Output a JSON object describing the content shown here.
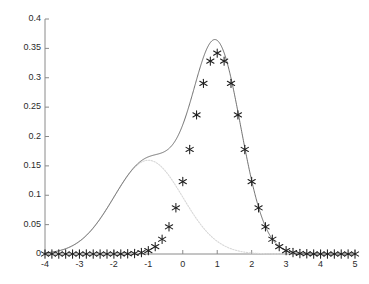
{
  "chart_data": {
    "type": "line",
    "title": "",
    "xlabel": "",
    "ylabel": "",
    "xlim": [
      -4,
      5
    ],
    "ylim": [
      0,
      0.4
    ],
    "grid": false,
    "legend": null,
    "xticks": [
      -4,
      -3,
      -2,
      -1,
      0,
      1,
      2,
      3,
      4,
      5
    ],
    "xtick_labels": [
      "-4",
      "-3",
      "-2",
      "-1",
      "0",
      "1",
      "2",
      "3",
      "4",
      "5"
    ],
    "yticks": [
      0,
      0.05,
      0.1,
      0.15,
      0.2,
      0.25,
      0.3,
      0.35,
      0.4
    ],
    "ytick_labels": [
      "0",
      "0.05",
      "0.1",
      "0.15",
      "0.2",
      "0.25",
      "0.3",
      "0.35",
      "0.4"
    ],
    "series": [
      {
        "name": "mixture-sum",
        "style": "solid-line",
        "color": "#4d4d4d",
        "linewidth": 0.8,
        "peak_x": 0.95,
        "peak_y": 0.362,
        "shoulder_x": -1.0,
        "shoulder_y": 0.163,
        "components": [
          {
            "weight": 0.4,
            "mean": -1.0,
            "sigma": 1.0
          },
          {
            "weight": 0.6,
            "mean": 1.0,
            "sigma": 0.7
          }
        ]
      },
      {
        "name": "component-1",
        "style": "dotted-line",
        "color": "#d8d8d8",
        "linewidth": 1.1,
        "peak_x": -1.0,
        "peak_y": 0.1596,
        "weight": 0.4,
        "mean": -1.0,
        "sigma": 1.0
      },
      {
        "name": "component-2",
        "style": "asterisk-markers",
        "color": "#1f1f1f",
        "marker": "asterisk",
        "marker_size": 4.2,
        "peak_x": 1.0,
        "peak_y": 0.342,
        "weight": 0.6,
        "mean": 1.0,
        "sigma": 0.7,
        "marker_step": 0.2,
        "marker_x": [
          -4.0,
          -3.8,
          -3.6,
          -3.4,
          -3.2,
          -3.0,
          -2.8,
          -2.6,
          -2.4,
          -2.2,
          -2.0,
          -1.8,
          -1.6,
          -1.4,
          -1.2,
          -1.0,
          -0.8,
          -0.6,
          -0.4,
          -0.2,
          0.0,
          0.2,
          0.4,
          0.6,
          0.8,
          1.0,
          1.2,
          1.4,
          1.6,
          1.8,
          2.0,
          2.2,
          2.4,
          2.6,
          2.8,
          3.0,
          3.2,
          3.4,
          3.6,
          3.8,
          4.0,
          4.2,
          4.4,
          4.6,
          4.8,
          5.0
        ],
        "marker_y": [
          0.0,
          0.0,
          0.0,
          0.0,
          0.0,
          0.0,
          0.0,
          0.0001,
          0.0002,
          0.0005,
          0.0011,
          0.0026,
          0.0056,
          0.0113,
          0.0212,
          0.0372,
          0.061,
          0.0937,
          0.1348,
          0.1815,
          0.229,
          0.2702,
          0.2985,
          0.3085,
          0.2985,
          0.342,
          0.3085,
          0.2985,
          0.2702,
          0.229,
          0.1815,
          0.1348,
          0.0937,
          0.061,
          0.0372,
          0.0212,
          0.0113,
          0.0056,
          0.0026,
          0.0011,
          0.0005,
          0.0002,
          0.0001,
          0.0,
          0.0,
          0.0
        ]
      }
    ],
    "axis": {
      "left_px": 45,
      "right_px": 355,
      "bottom_px": 254,
      "top_px": 19,
      "tick_length": 4,
      "axis_color": "#8a8a8a"
    }
  }
}
